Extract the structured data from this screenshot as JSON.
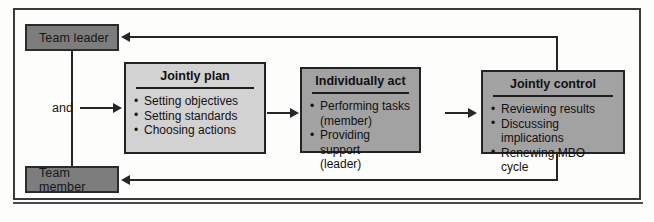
{
  "diagram": {
    "actors": [
      {
        "id": "team-leader",
        "label": "Team leader"
      },
      {
        "id": "team-member",
        "label": "Team member"
      }
    ],
    "connector_label": "and",
    "stages": [
      {
        "id": "jointly-plan",
        "title": "Jointly plan",
        "fill": "#d2d2d2",
        "items": [
          {
            "text": "Setting objectives",
            "continuation": false
          },
          {
            "text": "Setting standards",
            "continuation": false
          },
          {
            "text": "Choosing actions",
            "continuation": false
          }
        ]
      },
      {
        "id": "individually-act",
        "title": "Individually act",
        "fill": "#a2a2a2",
        "items": [
          {
            "text": "Performing tasks",
            "continuation": false
          },
          {
            "text": "(member)",
            "continuation": true
          },
          {
            "text": "Providing support",
            "continuation": false
          },
          {
            "text": "(leader)",
            "continuation": true
          }
        ]
      },
      {
        "id": "jointly-control",
        "title": "Jointly control",
        "fill": "#a2a2a2",
        "items": [
          {
            "text": "Reviewing results",
            "continuation": false
          },
          {
            "text": "Discussing implications",
            "continuation": false
          },
          {
            "text": "Renewing MBO cycle",
            "continuation": false
          }
        ]
      }
    ],
    "flow_arrows": [
      {
        "id": "and-to-plan",
        "direction": "right"
      },
      {
        "id": "plan-to-act",
        "direction": "right"
      },
      {
        "id": "act-to-control",
        "direction": "right"
      },
      {
        "id": "control-to-leader",
        "direction": "left"
      },
      {
        "id": "control-to-member",
        "direction": "left"
      }
    ],
    "colors": {
      "actor_fill": "#7d7d7d",
      "stage_light_fill": "#d2d2d2",
      "stage_dark_fill": "#a2a2a2",
      "line": "#262626",
      "frame": "#3a3a3a"
    }
  }
}
